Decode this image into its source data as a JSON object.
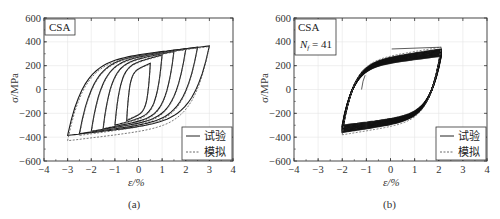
{
  "chart_data": [
    {
      "type": "line",
      "panel_caption": "(a)",
      "annotation": "CSA",
      "xlabel": "ε/%",
      "ylabel": "σ/MPa",
      "xlim": [
        -4,
        4
      ],
      "ylim": [
        -600,
        600
      ],
      "xticks": [
        -4,
        -3,
        -2,
        -1,
        0,
        1,
        2,
        3,
        4
      ],
      "xtick_labels": [
        "−4",
        "−3",
        "−2",
        "−1",
        "0",
        "1",
        "2",
        "3",
        "4"
      ],
      "yticks": [
        -600,
        -400,
        -200,
        0,
        200,
        400,
        600
      ],
      "ytick_labels": [
        "−600",
        "−400",
        "−200",
        "0",
        "200",
        "400",
        "600"
      ],
      "grid": true,
      "legend": [
        "试验",
        "模拟"
      ],
      "legend_position": "lower right",
      "series": [
        {
          "name": "试验",
          "style": "solid",
          "loops": [
            {
              "strain_amp": 0.5,
              "stress_max": 220,
              "stress_min": -260
            },
            {
              "strain_amp": 1.0,
              "stress_max": 290,
              "stress_min": -300
            },
            {
              "strain_amp": 1.5,
              "stress_max": 320,
              "stress_min": -330
            },
            {
              "strain_amp": 2.0,
              "stress_max": 340,
              "stress_min": -350
            },
            {
              "strain_amp": 2.5,
              "stress_max": 355,
              "stress_min": -370
            },
            {
              "strain_amp": 3.0,
              "stress_max": 365,
              "stress_min": -385
            }
          ]
        },
        {
          "name": "模拟",
          "style": "dashed",
          "loops": [
            {
              "strain_amp": 0.5,
              "stress_max": 215,
              "stress_min": -255
            },
            {
              "strain_amp": 1.0,
              "stress_max": 285,
              "stress_min": -310
            },
            {
              "strain_amp": 1.5,
              "stress_max": 315,
              "stress_min": -340
            },
            {
              "strain_amp": 2.0,
              "stress_max": 335,
              "stress_min": -360
            },
            {
              "strain_amp": 2.5,
              "stress_max": 350,
              "stress_min": -385
            },
            {
              "strain_amp": 3.0,
              "stress_max": 360,
              "stress_min": -430
            }
          ]
        }
      ]
    },
    {
      "type": "line",
      "panel_caption": "(b)",
      "annotation": "CSA",
      "annotation2": "N",
      "annotation2_sub": "f",
      "annotation2_value": " = 41",
      "xlabel": "ε/%",
      "ylabel": "σ/MPa",
      "xlim": [
        -4,
        4
      ],
      "ylim": [
        -600,
        600
      ],
      "xticks": [
        -4,
        -3,
        -2,
        -1,
        0,
        1,
        2,
        3,
        4
      ],
      "xtick_labels": [
        "−4",
        "−3",
        "−2",
        "−1",
        "0",
        "1",
        "2",
        "3",
        "4"
      ],
      "yticks": [
        -600,
        -400,
        -200,
        0,
        200,
        400,
        600
      ],
      "ytick_labels": [
        "−600",
        "−400",
        "−200",
        "0",
        "200",
        "400",
        "600"
      ],
      "grid": true,
      "legend": [
        "试验",
        "模拟"
      ],
      "legend_position": "lower right",
      "series": [
        {
          "name": "试验",
          "style": "solid",
          "strain_range": [
            -2.0,
            2.1
          ],
          "stress_max": 340,
          "stress_min": -360,
          "cycles": 41
        },
        {
          "name": "模拟",
          "style": "dashed",
          "strain_range": [
            -2.0,
            2.1
          ],
          "stress_max": 355,
          "stress_min": -380
        }
      ]
    }
  ]
}
